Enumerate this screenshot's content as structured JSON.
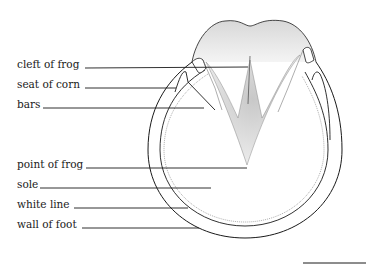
{
  "diagram": {
    "labels": [
      {
        "text": "cleft of frog",
        "x": 17,
        "y": 58
      },
      {
        "text": "seat of corn",
        "x": 17,
        "y": 78
      },
      {
        "text": "bars",
        "x": 17,
        "y": 98
      },
      {
        "text": "point of frog",
        "x": 17,
        "y": 158
      },
      {
        "text": "sole",
        "x": 17,
        "y": 178
      },
      {
        "text": "white line",
        "x": 17,
        "y": 198
      },
      {
        "text": "wall of foot",
        "x": 17,
        "y": 218
      }
    ],
    "colors": {
      "ink": "#1a1a1a",
      "stipple": "#b0b0b0",
      "background": "#ffffff"
    }
  }
}
